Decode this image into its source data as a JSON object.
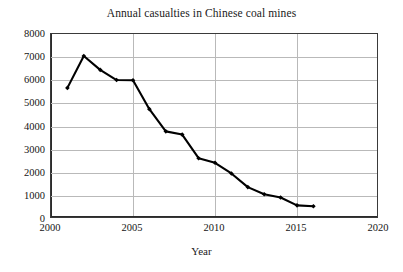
{
  "chart_data": {
    "type": "line",
    "title": "Annual casualties in Chinese coal mines",
    "xlabel": "Year",
    "ylabel": "",
    "x": [
      2001,
      2002,
      2003,
      2004,
      2005,
      2006,
      2007,
      2008,
      2009,
      2010,
      2011,
      2012,
      2013,
      2014,
      2015,
      2016
    ],
    "values": [
      5670,
      7050,
      6450,
      6010,
      6000,
      4750,
      3790,
      3650,
      2630,
      2430,
      1970,
      1380,
      1070,
      930,
      590,
      550
    ],
    "series": [
      {
        "name": "Annual casualties",
        "values": [
          5670,
          7050,
          6450,
          6010,
          6000,
          4750,
          3790,
          3650,
          2630,
          2430,
          1970,
          1380,
          1070,
          930,
          590,
          550
        ]
      }
    ],
    "xlim": [
      2000,
      2020
    ],
    "ylim": [
      0,
      8000
    ],
    "xticks": [
      2000,
      2005,
      2010,
      2015,
      2020
    ],
    "xtick_labels": [
      "2000",
      "2005",
      "2010",
      "2015",
      "2020"
    ],
    "yticks": [
      0,
      1000,
      2000,
      3000,
      4000,
      5000,
      6000,
      7000,
      8000
    ],
    "ytick_labels": [
      "0",
      "1000",
      "2000",
      "3000",
      "4000",
      "5000",
      "6000",
      "7000",
      "8000"
    ],
    "grid": true,
    "grid_axis": "both",
    "legend": false,
    "legend_position": "none",
    "marker": "diamond",
    "line_color": "#000000",
    "marker_color": "#000000",
    "grid_color": "#b9b9b9",
    "axis_color": "#2b2b2b",
    "background_color": "#ffffff"
  }
}
